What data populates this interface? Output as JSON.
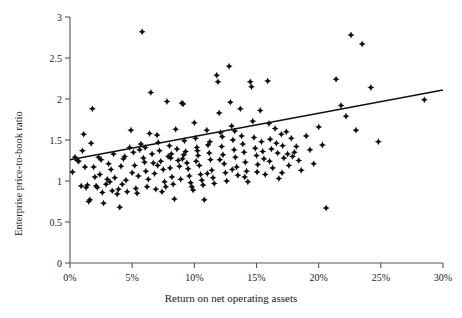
{
  "chart_data": {
    "type": "scatter",
    "title": "",
    "xlabel": "Return on net operating assets",
    "ylabel": "Enterprise price-to-book ratio",
    "xlim": [
      0,
      30
    ],
    "ylim": [
      0,
      3
    ],
    "x_unit": "%",
    "grid": false,
    "legend": "none",
    "x_ticks": [
      0,
      5,
      10,
      15,
      20,
      25,
      30
    ],
    "x_tick_labels": [
      "0%",
      "5%",
      "10%",
      "15%",
      "20%",
      "25%",
      "30%"
    ],
    "y_ticks": [
      0,
      0.5,
      1,
      1.5,
      2,
      2.5,
      3
    ],
    "y_tick_labels": [
      "0",
      "0.5",
      "1",
      "1.5",
      "2",
      "2.5",
      "3"
    ],
    "marker": "diamond",
    "marker_color": "#111111",
    "trendline": {
      "type": "linear",
      "color": "#111111",
      "x_start": 0,
      "y_start": 1.26,
      "x_end": 30,
      "y_end": 2.11
    },
    "points": [
      [
        0.2,
        1.11
      ],
      [
        0.4,
        1.29
      ],
      [
        0.6,
        1.25
      ],
      [
        0.7,
        1.24
      ],
      [
        0.9,
        0.94
      ],
      [
        1.0,
        1.37
      ],
      [
        1.1,
        1.57
      ],
      [
        1.2,
        1.17
      ],
      [
        1.3,
        0.92
      ],
      [
        1.4,
        0.95
      ],
      [
        1.5,
        0.75
      ],
      [
        1.6,
        0.77
      ],
      [
        1.8,
        1.88
      ],
      [
        1.9,
        1.17
      ],
      [
        2.0,
        1.05
      ],
      [
        2.1,
        0.94
      ],
      [
        2.2,
        0.92
      ],
      [
        2.3,
        1.29
      ],
      [
        2.5,
        1.26
      ],
      [
        2.6,
        0.86
      ],
      [
        2.7,
        0.73
      ],
      [
        2.9,
        0.96
      ],
      [
        3.0,
        1.02
      ],
      [
        3.2,
        0.99
      ],
      [
        3.3,
        1.14
      ],
      [
        3.4,
        0.88
      ],
      [
        3.5,
        1.33
      ],
      [
        3.6,
        1.04
      ],
      [
        3.8,
        0.84
      ],
      [
        3.9,
        0.9
      ],
      [
        4.0,
        0.68
      ],
      [
        4.1,
        1.18
      ],
      [
        4.3,
        1.27
      ],
      [
        4.4,
        1.3
      ],
      [
        4.5,
        1.01
      ],
      [
        4.6,
        0.87
      ],
      [
        4.8,
        1.41
      ],
      [
        4.9,
        1.62
      ],
      [
        5.0,
        1.1
      ],
      [
        5.1,
        1.35
      ],
      [
        5.2,
        1.19
      ],
      [
        5.3,
        0.91
      ],
      [
        5.4,
        0.85
      ],
      [
        5.6,
        1.38
      ],
      [
        5.7,
        1.45
      ],
      [
        5.8,
        2.82
      ],
      [
        5.9,
        1.28
      ],
      [
        6.0,
        1.23
      ],
      [
        6.1,
        1.12
      ],
      [
        6.2,
        0.93
      ],
      [
        6.4,
        1.58
      ],
      [
        6.5,
        2.08
      ],
      [
        6.6,
        1.33
      ],
      [
        6.7,
        1.22
      ],
      [
        6.8,
        1.09
      ],
      [
        6.9,
        0.9
      ],
      [
        7.0,
        1.56
      ],
      [
        7.1,
        1.47
      ],
      [
        7.2,
        1.37
      ],
      [
        7.3,
        1.24
      ],
      [
        7.5,
        1.14
      ],
      [
        7.6,
        0.99
      ],
      [
        7.7,
        0.93
      ],
      [
        7.8,
        1.97
      ],
      [
        7.9,
        1.3
      ],
      [
        8.0,
        1.43
      ],
      [
        8.1,
        1.28
      ],
      [
        8.2,
        1.05
      ],
      [
        8.3,
        0.96
      ],
      [
        8.4,
        0.78
      ],
      [
        8.5,
        1.63
      ],
      [
        8.6,
        1.39
      ],
      [
        8.7,
        1.25
      ],
      [
        8.8,
        1.18
      ],
      [
        8.9,
        1.02
      ],
      [
        9.0,
        1.95
      ],
      [
        9.1,
        1.94
      ],
      [
        9.2,
        1.49
      ],
      [
        9.3,
        1.36
      ],
      [
        9.4,
        1.22
      ],
      [
        9.5,
        1.15
      ],
      [
        9.6,
        1.06
      ],
      [
        9.7,
        0.98
      ],
      [
        9.8,
        0.93
      ],
      [
        9.9,
        0.89
      ],
      [
        10.0,
        1.71
      ],
      [
        10.1,
        1.52
      ],
      [
        10.2,
        1.41
      ],
      [
        10.3,
        1.31
      ],
      [
        10.4,
        1.19
      ],
      [
        10.5,
        1.08
      ],
      [
        10.6,
        1.01
      ],
      [
        10.7,
        0.95
      ],
      [
        10.8,
        0.77
      ],
      [
        11.0,
        1.62
      ],
      [
        11.1,
        1.44
      ],
      [
        11.2,
        1.34
      ],
      [
        11.3,
        1.26
      ],
      [
        11.4,
        1.13
      ],
      [
        11.5,
        1.04
      ],
      [
        11.6,
        0.97
      ],
      [
        11.8,
        2.29
      ],
      [
        11.9,
        2.21
      ],
      [
        12.0,
        1.83
      ],
      [
        12.1,
        1.59
      ],
      [
        12.2,
        1.42
      ],
      [
        12.3,
        1.32
      ],
      [
        12.4,
        1.21
      ],
      [
        12.5,
        1.1
      ],
      [
        12.6,
        1.0
      ],
      [
        12.8,
        2.4
      ],
      [
        12.9,
        1.96
      ],
      [
        13.0,
        1.67
      ],
      [
        13.1,
        1.5
      ],
      [
        13.2,
        1.38
      ],
      [
        13.3,
        1.29
      ],
      [
        13.4,
        1.17
      ],
      [
        13.5,
        1.07
      ],
      [
        13.7,
        1.88
      ],
      [
        13.8,
        1.55
      ],
      [
        13.9,
        1.45
      ],
      [
        14.0,
        1.35
      ],
      [
        14.1,
        1.23
      ],
      [
        14.2,
        1.12
      ],
      [
        14.3,
        0.99
      ],
      [
        14.5,
        2.21
      ],
      [
        14.6,
        2.15
      ],
      [
        14.7,
        1.73
      ],
      [
        14.8,
        1.53
      ],
      [
        14.9,
        1.4
      ],
      [
        15.0,
        1.31
      ],
      [
        15.1,
        1.2
      ],
      [
        15.3,
        1.86
      ],
      [
        15.4,
        1.48
      ],
      [
        15.5,
        1.36
      ],
      [
        15.6,
        1.27
      ],
      [
        15.7,
        1.08
      ],
      [
        15.9,
        2.22
      ],
      [
        16.0,
        1.7
      ],
      [
        16.1,
        1.51
      ],
      [
        16.2,
        1.39
      ],
      [
        16.3,
        1.16
      ],
      [
        16.5,
        1.64
      ],
      [
        16.6,
        1.46
      ],
      [
        16.7,
        1.34
      ],
      [
        16.8,
        1.03
      ],
      [
        17.0,
        1.57
      ],
      [
        17.1,
        1.43
      ],
      [
        17.2,
        1.28
      ],
      [
        17.4,
        1.6
      ],
      [
        17.5,
        1.33
      ],
      [
        17.6,
        1.19
      ],
      [
        17.8,
        1.52
      ],
      [
        17.9,
        1.3
      ],
      [
        18.2,
        1.42
      ],
      [
        18.4,
        1.25
      ],
      [
        18.6,
        1.13
      ],
      [
        19.0,
        1.55
      ],
      [
        19.3,
        1.38
      ],
      [
        19.6,
        1.21
      ],
      [
        20.0,
        1.66
      ],
      [
        20.3,
        1.44
      ],
      [
        20.6,
        0.67
      ],
      [
        21.4,
        2.24
      ],
      [
        21.8,
        1.92
      ],
      [
        22.2,
        1.79
      ],
      [
        22.6,
        2.78
      ],
      [
        23.0,
        1.62
      ],
      [
        23.5,
        2.67
      ],
      [
        24.2,
        2.14
      ],
      [
        24.8,
        1.48
      ],
      [
        28.5,
        1.99
      ],
      [
        1.7,
        1.46
      ],
      [
        2.4,
        1.08
      ],
      [
        3.1,
        1.21
      ],
      [
        4.2,
        0.96
      ],
      [
        5.5,
        1.06
      ],
      [
        6.3,
        1.02
      ],
      [
        7.4,
        0.87
      ],
      [
        8.15,
        1.33
      ],
      [
        9.05,
        1.27
      ],
      [
        10.15,
        1.24
      ],
      [
        11.05,
        1.09
      ],
      [
        12.05,
        1.26
      ],
      [
        13.05,
        1.14
      ],
      [
        14.05,
        1.05
      ],
      [
        15.05,
        1.11
      ],
      [
        16.05,
        1.24
      ],
      [
        17.05,
        1.1
      ],
      [
        18.05,
        1.35
      ],
      [
        6.05,
        1.41
      ],
      [
        7.05,
        1.19
      ],
      [
        8.05,
        1.16
      ],
      [
        9.15,
        1.32
      ],
      [
        10.25,
        1.37
      ],
      [
        11.25,
        1.48
      ],
      [
        12.25,
        1.54
      ],
      [
        13.25,
        1.61
      ]
    ]
  }
}
